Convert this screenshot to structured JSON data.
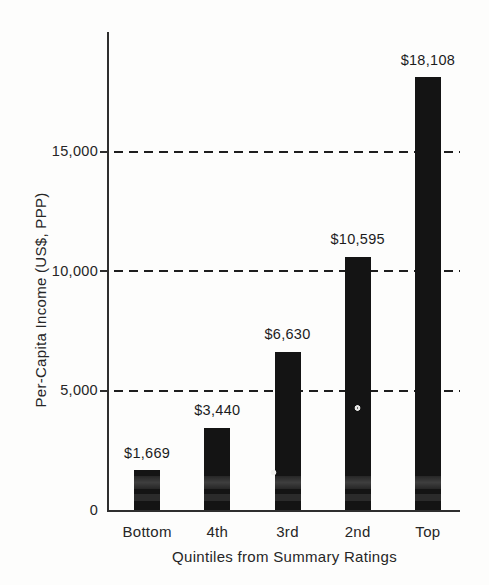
{
  "chart_data": {
    "type": "bar",
    "title": "",
    "xlabel": "Quintiles from Summary Ratings",
    "ylabel": "Per-Capita Income (US$, PPP)",
    "categories": [
      "Bottom",
      "4th",
      "3rd",
      "2nd",
      "Top"
    ],
    "values": [
      1669,
      3440,
      6630,
      10595,
      18108
    ],
    "value_labels": [
      "$1,669",
      "$3,440",
      "$6,630",
      "$10,595",
      "$18,108"
    ],
    "ylim": [
      0,
      20000
    ],
    "yticks": [
      {
        "value": 0,
        "label": "0"
      },
      {
        "value": 5000,
        "label": "5,000"
      },
      {
        "value": 10000,
        "label": "10,000"
      },
      {
        "value": 15000,
        "label": "15,000"
      }
    ],
    "gridlines": {
      "values": [
        5000,
        10000,
        15000
      ],
      "style": "dashed"
    },
    "legend": "none",
    "bar_color": "#141414",
    "axis_color": "#2e2e2e",
    "text_color": "#222222",
    "background_color": "#fdfdfc"
  }
}
